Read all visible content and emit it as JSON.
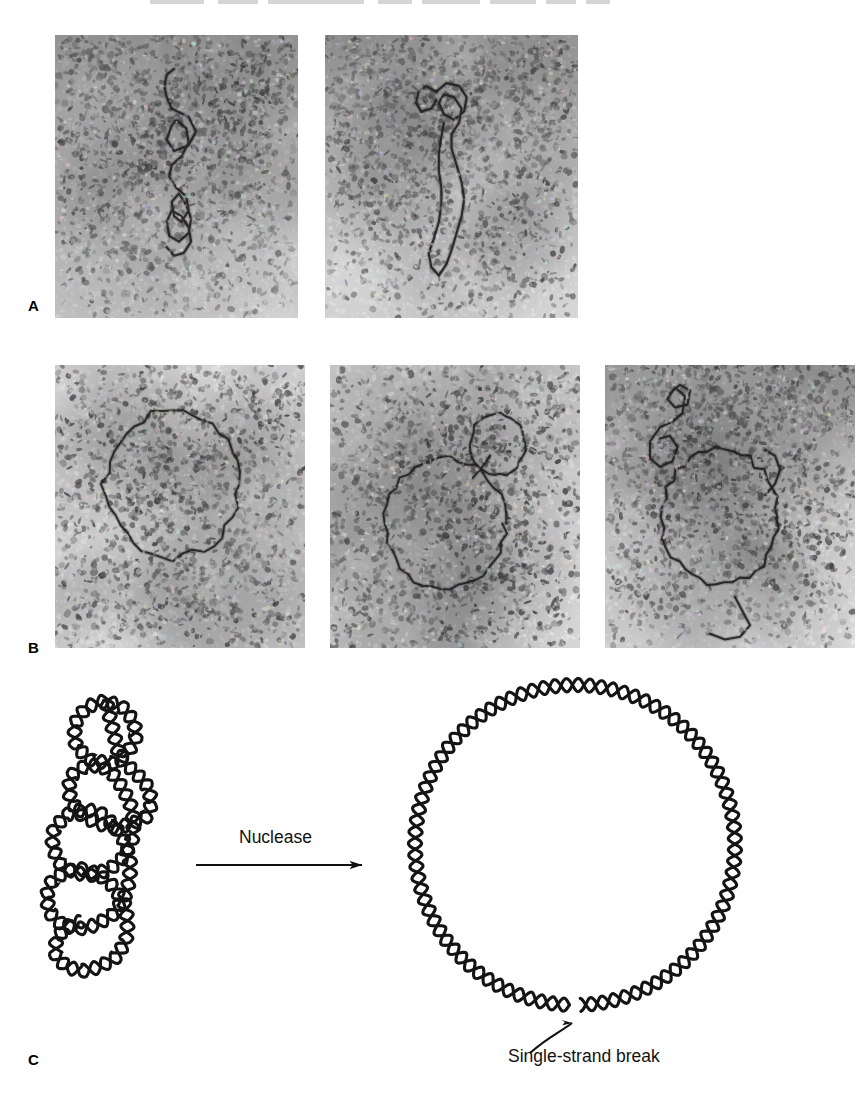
{
  "figure": {
    "panels": [
      {
        "letter": "A",
        "label_name": "panel-label-a",
        "caption_text": "",
        "micrographs": [
          {
            "name": "em-a1",
            "content": "supercoiled circular DNA molecule, vertical interwound plectoneme"
          },
          {
            "name": "em-a2",
            "content": "supercoiled circular DNA molecule with branched loop at top"
          }
        ]
      },
      {
        "letter": "B",
        "label_name": "panel-label-b",
        "caption_text": "",
        "micrographs": [
          {
            "name": "em-b1",
            "content": "relaxed open circular DNA molecule"
          },
          {
            "name": "em-b2",
            "content": "relaxed circular DNA with small secondary loop at upper right"
          },
          {
            "name": "em-b3",
            "content": "relaxed circular DNA with tangled free end region at upper left"
          }
        ]
      },
      {
        "letter": "C",
        "label_name": "panel-label-c",
        "caption_text": "",
        "micrographs": []
      }
    ],
    "schematic": {
      "reaction_label": "Nuclease",
      "break_label": "Single-strand break",
      "left_structure": "supercoiled double-helix circle",
      "right_structure": "relaxed double-helix circle",
      "arrow_direction": "left-to-right"
    },
    "colors": {
      "ink": "#111111",
      "helix": "#1a1a1a",
      "background": "#ffffff",
      "micrograph_mid": "#b9b9b9"
    }
  }
}
